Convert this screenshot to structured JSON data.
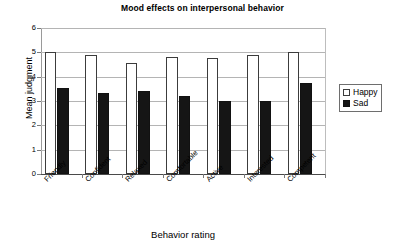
{
  "chart_data": {
    "type": "bar",
    "title": "Mood effects on interpersonal behavior",
    "xlabel": "Behavior rating",
    "ylabel": "Mean judgment",
    "categories": [
      "Friendly",
      "Confident",
      "Relaxed",
      "Comfortable",
      "Active",
      "Interested",
      "Competent"
    ],
    "series": [
      {
        "name": "Happy",
        "values": [
          5.02,
          4.88,
          4.57,
          4.8,
          4.77,
          4.88,
          5.02
        ],
        "color": "#ffffff"
      },
      {
        "name": "Sad",
        "values": [
          3.55,
          3.33,
          3.42,
          3.2,
          3.02,
          3.01,
          3.74
        ],
        "color": "#151515"
      }
    ],
    "ylim": [
      0,
      6
    ],
    "yticks": [
      0,
      1,
      2,
      3,
      4,
      5,
      6
    ],
    "ytick_labels": [
      "0",
      "1",
      "2",
      "3",
      "4",
      "5",
      "6"
    ],
    "grid": true,
    "grid_axis": "y",
    "legend_position": "right",
    "legend_entries": [
      "Happy",
      "Sad"
    ],
    "xtick_label_rotation": -45
  }
}
